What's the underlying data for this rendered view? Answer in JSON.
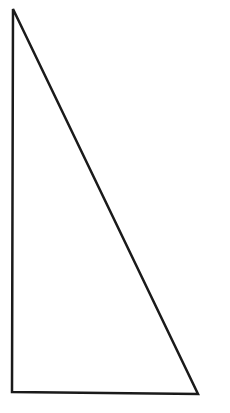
{
  "diagram": {
    "shape": "right-triangle",
    "stroke_color": "#1a1a1a",
    "fill_color": "#ffffff",
    "stroke_width": 2.5,
    "vertices": [
      [
        13,
        9
      ],
      [
        12,
        392
      ],
      [
        198,
        394
      ]
    ]
  }
}
